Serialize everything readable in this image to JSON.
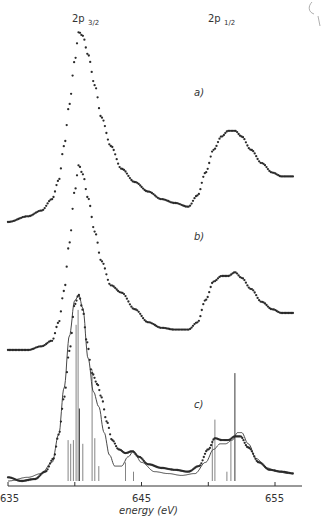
{
  "chart_data": {
    "type": "scatter",
    "title": "",
    "xlabel": "energy (eV)",
    "ylabel": "",
    "xlim": [
      635,
      657
    ],
    "x_ticks": [
      635,
      640,
      645,
      650,
      655
    ],
    "x_tick_labels": [
      "635",
      "",
      "645",
      "",
      "655"
    ],
    "grid": false,
    "legend": "none",
    "annotations": [
      {
        "text": "2p",
        "sub": "3/2",
        "x_energy": 640.2,
        "position": "top"
      },
      {
        "text": "2p",
        "sub": "1/2",
        "x_energy": 652.3,
        "position": "top"
      },
      {
        "text": "a)",
        "panel": "a"
      },
      {
        "text": "b)",
        "panel": "b"
      },
      {
        "text": "c)",
        "panel": "c"
      }
    ],
    "panels_note": "Three vertically offset spectra (a, b, c) sharing the same energy axis; intensity in arbitrary units (relative, 0 = panel baseline, 1 = 2p3/2 peak).",
    "series": [
      {
        "name": "a) experimental",
        "style": "dots",
        "x": [
          635.0,
          636.5,
          637.5,
          638.3,
          638.8,
          639.2,
          639.6,
          640.0,
          640.3,
          640.6,
          641.0,
          641.5,
          642.0,
          642.7,
          643.5,
          644.5,
          645.5,
          646.5,
          647.5,
          648.5,
          649.2,
          649.8,
          650.4,
          651.0,
          651.5,
          652.0,
          652.5,
          653.2,
          654.0,
          654.8,
          655.5,
          656.4
        ],
        "y": [
          0.0,
          0.03,
          0.06,
          0.12,
          0.22,
          0.4,
          0.62,
          0.85,
          1.0,
          0.98,
          0.88,
          0.72,
          0.55,
          0.4,
          0.28,
          0.21,
          0.16,
          0.12,
          0.1,
          0.08,
          0.14,
          0.26,
          0.38,
          0.45,
          0.48,
          0.48,
          0.45,
          0.38,
          0.31,
          0.26,
          0.24,
          0.24
        ]
      },
      {
        "name": "b) experimental",
        "style": "dots",
        "x": [
          635.0,
          636.5,
          637.5,
          638.3,
          638.8,
          639.2,
          639.6,
          640.0,
          640.3,
          640.6,
          641.0,
          641.5,
          642.0,
          642.7,
          643.5,
          644.5,
          645.5,
          646.5,
          647.5,
          648.5,
          649.2,
          649.8,
          650.4,
          651.0,
          651.5,
          652.0,
          652.5,
          653.2,
          654.0,
          654.8,
          655.5,
          656.4
        ],
        "y": [
          0.0,
          0.0,
          0.02,
          0.05,
          0.15,
          0.32,
          0.58,
          0.86,
          1.0,
          0.95,
          0.82,
          0.64,
          0.48,
          0.35,
          0.31,
          0.22,
          0.15,
          0.12,
          0.11,
          0.11,
          0.15,
          0.27,
          0.37,
          0.4,
          0.4,
          0.42,
          0.39,
          0.33,
          0.26,
          0.22,
          0.2,
          0.2
        ]
      },
      {
        "name": "c) experimental",
        "style": "dots",
        "x": [
          635.0,
          636.0,
          637.0,
          637.8,
          638.4,
          638.8,
          639.2,
          639.6,
          640.0,
          640.3,
          640.6,
          640.9,
          641.3,
          641.7,
          642.0,
          642.4,
          642.8,
          643.3,
          643.8,
          644.3,
          644.8,
          645.5,
          646.5,
          647.5,
          648.5,
          649.3,
          650.0,
          650.5,
          651.0,
          651.5,
          652.0,
          652.4,
          653.0,
          653.8,
          654.6,
          655.5,
          656.4
        ],
        "y": [
          0.02,
          0.0,
          0.01,
          0.05,
          0.12,
          0.25,
          0.45,
          0.7,
          0.95,
          1.0,
          0.92,
          0.75,
          0.58,
          0.52,
          0.45,
          0.32,
          0.22,
          0.17,
          0.15,
          0.16,
          0.13,
          0.09,
          0.07,
          0.06,
          0.05,
          0.08,
          0.17,
          0.23,
          0.22,
          0.22,
          0.24,
          0.24,
          0.18,
          0.1,
          0.06,
          0.05,
          0.04
        ]
      },
      {
        "name": "c) calculated fit",
        "style": "line",
        "x": [
          635.0,
          636.5,
          637.5,
          638.3,
          638.8,
          639.2,
          639.6,
          640.0,
          640.3,
          640.6,
          641.0,
          641.4,
          641.8,
          642.2,
          642.6,
          643.0,
          643.5,
          644.0,
          644.4,
          645.0,
          646.0,
          647.0,
          648.0,
          649.0,
          649.8,
          650.4,
          650.9,
          651.3,
          651.8,
          652.2,
          652.5,
          653.0,
          653.6,
          654.4,
          655.2,
          656.0
        ],
        "y": [
          0.0,
          0.02,
          0.04,
          0.1,
          0.25,
          0.5,
          0.78,
          0.97,
          1.0,
          0.93,
          0.66,
          0.48,
          0.4,
          0.26,
          0.14,
          0.08,
          0.08,
          0.13,
          0.16,
          0.1,
          0.05,
          0.04,
          0.03,
          0.04,
          0.1,
          0.17,
          0.2,
          0.2,
          0.22,
          0.26,
          0.26,
          0.2,
          0.12,
          0.07,
          0.05,
          0.04
        ]
      },
      {
        "name": "c) multiplet sticks",
        "style": "sticks",
        "x": [
          639.5,
          639.7,
          639.9,
          640.1,
          640.25,
          640.35,
          640.6,
          641.3,
          641.5,
          641.8,
          643.8,
          644.4,
          650.3,
          650.5,
          651.4,
          651.7,
          652.0
        ],
        "y": [
          0.22,
          0.2,
          0.22,
          0.84,
          0.92,
          0.39,
          0.2,
          0.6,
          0.23,
          0.08,
          0.1,
          0.05,
          0.22,
          0.33,
          0.05,
          0.22,
          0.58
        ]
      }
    ]
  },
  "figure": {
    "peak_label_3_2_main": "2p",
    "peak_label_3_2_sub": "3/2",
    "peak_label_1_2_main": "2p",
    "peak_label_1_2_sub": "1/2",
    "panel_a": "a)",
    "panel_b": "b)",
    "panel_c": "c)",
    "x_axis_title": "energy (eV)",
    "tick_635": "635",
    "tick_645": "645",
    "tick_655": "655"
  }
}
